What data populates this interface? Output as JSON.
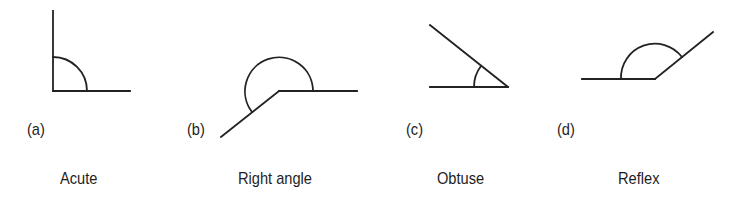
{
  "diagram": {
    "stroke_color": "#222222",
    "background": "#ffffff",
    "figures": [
      {
        "id": "a",
        "letter": "(a)",
        "name": "Acute",
        "vertex": [
          53,
          91
        ],
        "ray1_end": [
          130,
          91
        ],
        "ray2_end": [
          53,
          11
        ],
        "arc_radius": 34
      },
      {
        "id": "b",
        "letter": "(b)",
        "name": "Right angle",
        "vertex": [
          279,
          91
        ],
        "ray1_end": [
          357,
          91
        ],
        "ray2_end": [
          221,
          137
        ],
        "arc_radius": 34
      },
      {
        "id": "c",
        "letter": "(c)",
        "name": "Obtuse",
        "vertex": [
          508,
          87
        ],
        "ray1_end": [
          430,
          87
        ],
        "ray2_end": [
          430,
          25
        ],
        "arc_radius": 34
      },
      {
        "id": "d",
        "letter": "(d)",
        "name": "Reflex",
        "vertex": [
          655,
          79
        ],
        "ray1_end": [
          582,
          79
        ],
        "ray2_end": [
          713,
          32
        ],
        "arc_radius": 34
      }
    ]
  }
}
